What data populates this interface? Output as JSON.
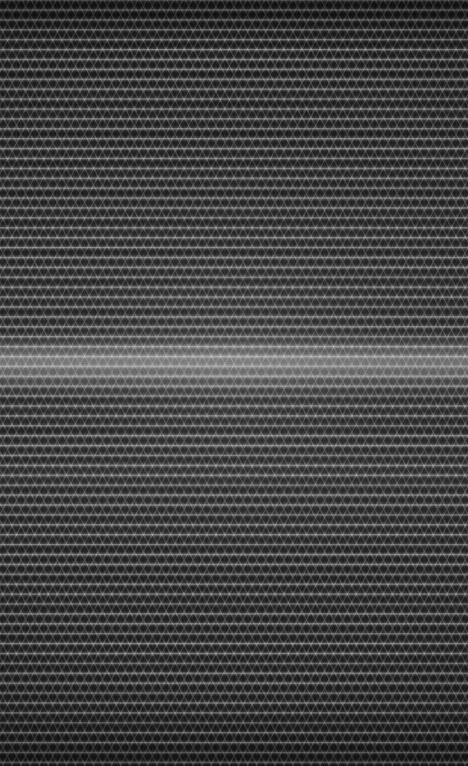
{
  "image": {
    "domain": "Natural-Image",
    "subject": "dark woven mesh fabric macro photograph",
    "width": 468,
    "height": 766,
    "orientation": "portrait",
    "has_text": false,
    "has_ui_chrome": false,
    "alt_text": "Close-up macro photograph of dark charcoal woven or knitted mesh fabric showing a repeating diamond lattice pattern arranged in horizontal rows, with a broad soft specular highlight band running across the middle of the frame."
  },
  "appearance": {
    "base_color": "#2a2a2a",
    "shadow_color": "#1c1c1c",
    "thread_highlight_color": "#bdbdbd",
    "thread_midtone_color": "#6e6e6e",
    "darkest_color": "#121212",
    "brightest_color": "#9a9a9a",
    "overall_tone": "low-key monochrome charcoal"
  },
  "texture": {
    "weave_type": "diamond lattice mesh",
    "row_structure": "horizontal knit courses",
    "row_period_px": 10,
    "diamond_cell_width_px": 8,
    "diagonal_thread_angle_deg": 62,
    "vertical_wale_period_px": 4,
    "notes": "Two opposing diagonal thread families cross to form diamond cells; rows are separated by darker recessed channels."
  },
  "lighting": {
    "type": "broad horizontal specular highlight",
    "band_center_y": 362,
    "band_top_y": 335,
    "band_bottom_y": 398,
    "band_peak_intensity": 0.26,
    "lateral_falloff": "brighter at left, gently dimming toward the right edge",
    "secondary_sheen_y": 470,
    "vignette_strength": 0.48
  },
  "grain": {
    "type": "film-like luminance noise",
    "base_frequency": 0.85,
    "opacity": 0.3
  }
}
